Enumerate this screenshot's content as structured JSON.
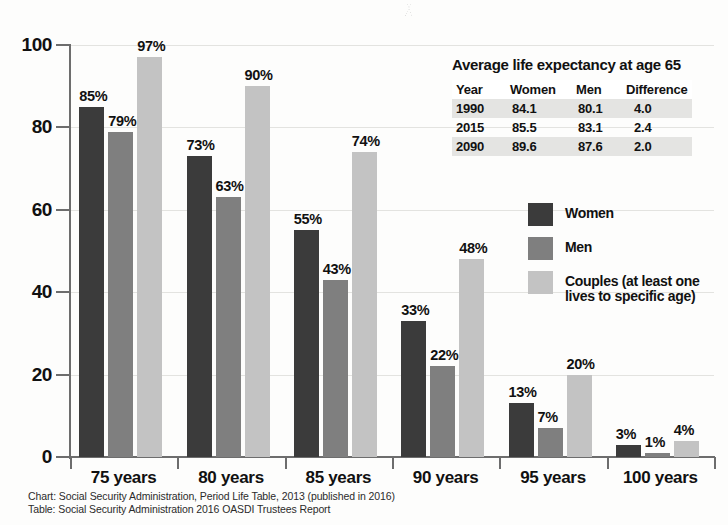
{
  "chart_data": {
    "type": "bar",
    "title": "",
    "xlabel": "",
    "ylabel": "",
    "ylim": [
      0,
      100
    ],
    "yticks": [
      0,
      20,
      40,
      60,
      80,
      100
    ],
    "grid": true,
    "legend_position": "right",
    "categories": [
      "75 years",
      "80 years",
      "85 years",
      "90 years",
      "95 years",
      "100 years"
    ],
    "series": [
      {
        "name": "Women",
        "color": "#3b3b3b",
        "values": [
          85,
          73,
          55,
          33,
          13,
          3
        ],
        "labels": [
          "85%",
          "73%",
          "55%",
          "33%",
          "13%",
          "3%"
        ]
      },
      {
        "name": "Men",
        "color": "#7f7f7f",
        "values": [
          79,
          63,
          43,
          22,
          7,
          1
        ],
        "labels": [
          "79%",
          "63%",
          "43%",
          "22%",
          "7%",
          "1%"
        ]
      },
      {
        "name": "Couples (at least one lives to specific age)",
        "color": "#c3c3c3",
        "values": [
          97,
          90,
          74,
          48,
          20,
          4
        ],
        "labels": [
          "97%",
          "90%",
          "74%",
          "48%",
          "20%",
          "4%"
        ]
      }
    ]
  },
  "axis": {
    "ytick_labels": [
      "100",
      "80",
      "60",
      "40",
      "20",
      "0"
    ]
  },
  "legend": {
    "items": [
      {
        "label": "Women",
        "swatch": "women"
      },
      {
        "label": "Men",
        "swatch": "men"
      },
      {
        "label": "Couples (at least one",
        "label2": "lives to specific age)",
        "swatch": "couples"
      }
    ]
  },
  "table": {
    "title": "Average life expectancy at age 65",
    "headers": [
      "Year",
      "Women",
      "Men",
      "Difference"
    ],
    "rows": [
      {
        "year": "1990",
        "women": "84.1",
        "men": "80.1",
        "difference": "4.0",
        "shaded": true
      },
      {
        "year": "2015",
        "women": "85.5",
        "men": "83.1",
        "difference": "2.4",
        "shaded": false
      },
      {
        "year": "2090",
        "women": "89.6",
        "men": "87.6",
        "difference": "2.0",
        "shaded": true
      }
    ]
  },
  "footer": {
    "line1": "Chart: Social Security Administration, Period Life Table, 2013 (published in 2016)",
    "line2": "Table: Social Security Administration 2016 OASDI Trustees Report"
  }
}
